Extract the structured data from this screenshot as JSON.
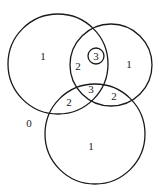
{
  "diagram": {
    "type": "venn",
    "stroke_color": "#1a1a1a",
    "background": "#ffffff",
    "circles": [
      {
        "id": "A",
        "cx": 58,
        "cy": 64,
        "r": 50
      },
      {
        "id": "B",
        "cx": 111,
        "cy": 65,
        "r": 41
      },
      {
        "id": "C",
        "cx": 95,
        "cy": 134,
        "r": 50
      },
      {
        "id": "small",
        "cx": 96,
        "cy": 56,
        "r": 8
      }
    ],
    "labels": [
      {
        "text": "1",
        "x": 43,
        "y": 56,
        "region": "A only"
      },
      {
        "text": "2",
        "x": 78,
        "y": 66,
        "region": "A and B"
      },
      {
        "text": "3",
        "x": 96,
        "y": 56,
        "region": "small circle (circled)"
      },
      {
        "text": "1",
        "x": 129,
        "y": 64,
        "region": "B only"
      },
      {
        "text": "3",
        "x": 91,
        "y": 89,
        "region": "A, B and C"
      },
      {
        "text": "2",
        "x": 69,
        "y": 102,
        "region": "A and C"
      },
      {
        "text": "2",
        "x": 114,
        "y": 96,
        "region": "B and C"
      },
      {
        "text": "0",
        "x": 29,
        "y": 123,
        "region": "outside"
      },
      {
        "text": "1",
        "x": 91,
        "y": 146,
        "region": "C only"
      }
    ]
  }
}
